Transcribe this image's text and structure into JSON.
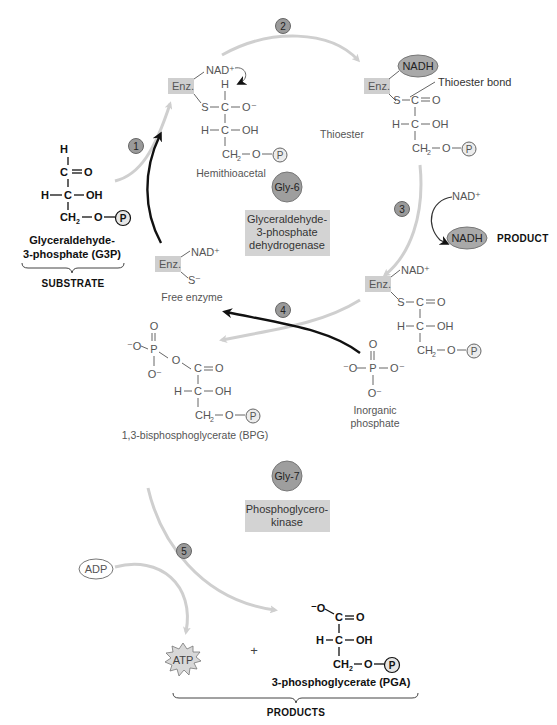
{
  "steps": [
    "1",
    "2",
    "3",
    "4",
    "5"
  ],
  "substrate": {
    "atoms": {
      "h": "H",
      "c1": "C",
      "o": "O",
      "h2": "H",
      "c2": "C",
      "oh": "OH",
      "ch2": "CH",
      "sub2": "2",
      "o2": "O",
      "p": "P"
    },
    "name_line1": "Glyceraldehyde-",
    "name_line2": "3-phosphate (G3P)",
    "category": "SUBSTRATE"
  },
  "hemithioacetal": {
    "enz": "Enz.",
    "nad": "NAD⁺",
    "atoms": {
      "h": "H",
      "s": "S",
      "c1": "C",
      "o_minus": "O⁻",
      "h2": "H",
      "c2": "C",
      "oh": "OH",
      "ch2": "CH",
      "sub2": "2",
      "o": "O",
      "p": "P"
    },
    "label": "Hemithioacetal"
  },
  "thioester": {
    "enz": "Enz.",
    "nadh": "NADH",
    "bond_label": "Thioester bond",
    "atoms": {
      "s": "S",
      "c1": "C",
      "o": "O",
      "h": "H",
      "c2": "C",
      "oh": "OH",
      "ch2": "CH",
      "sub2": "2",
      "o2": "O",
      "p": "P"
    },
    "label": "Thioester"
  },
  "enzyme1": {
    "badge": "Gly-6",
    "name_line1": "Glyceraldehyde-",
    "name_line2": "3-phosphate",
    "name_line3": "dehydrogenase"
  },
  "step3": {
    "nad_in": "NAD⁺",
    "nadh_out": "NADH",
    "product_label": "PRODUCT"
  },
  "free_enzyme": {
    "enz": "Enz.",
    "nad": "NAD⁺",
    "s": "S⁻",
    "label": "Free enzyme"
  },
  "thioester_nad": {
    "enz": "Enz.",
    "nad": "NAD⁺",
    "atoms": {
      "s": "S",
      "c1": "C",
      "o": "O",
      "h": "H",
      "c2": "C",
      "oh": "OH",
      "ch2": "CH",
      "sub2": "2",
      "o2": "O",
      "p": "P"
    }
  },
  "bpg": {
    "atoms": {
      "o_top": "O",
      "o_minus_left": "⁻O",
      "p": "P",
      "o_bridge": "O",
      "o_minus_bottom": "O⁻",
      "c1": "C",
      "o": "O",
      "h": "H",
      "c2": "C",
      "oh": "OH",
      "ch2": "CH",
      "sub2": "2",
      "o2": "O",
      "pc": "P"
    },
    "label": "1,3-bisphosphoglycerate (BPG)"
  },
  "inorganic_phosphate": {
    "atoms": {
      "o_top": "O",
      "o_minus_left": "⁻O",
      "p": "P",
      "o_minus_right": "O⁻",
      "o_minus_bottom": "O⁻"
    },
    "label_line1": "Inorganic",
    "label_line2": "phosphate"
  },
  "enzyme2": {
    "badge": "Gly-7",
    "name_line1": "Phosphoglycero-",
    "name_line2": "kinase"
  },
  "step5": {
    "adp": "ADP",
    "atp": "ATP",
    "plus": "+"
  },
  "pga": {
    "atoms": {
      "o_minus": "⁻O",
      "c1": "C",
      "o": "O",
      "h": "H",
      "c2": "C",
      "oh": "OH",
      "ch2": "CH",
      "sub2": "2",
      "o2": "O",
      "p": "P"
    },
    "label": "3-phosphoglycerate (PGA)",
    "category": "PRODUCTS"
  }
}
